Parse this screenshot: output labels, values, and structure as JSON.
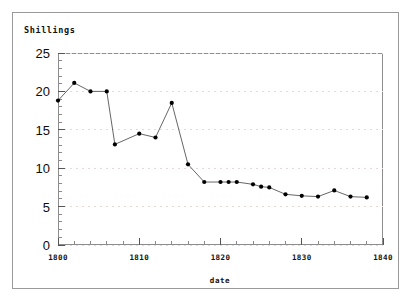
{
  "figure": {
    "y_axis_title": "Shillings",
    "x_axis_title": "date"
  },
  "chart_data": {
    "type": "line",
    "title": "",
    "subtitle": "",
    "xlabel": "date",
    "ylabel": "Shillings",
    "xlim": [
      1800,
      1840
    ],
    "ylim": [
      0,
      25
    ],
    "grid": true,
    "grid_axis": "y",
    "grid_style": "dotted",
    "legend": false,
    "legend_position": "none",
    "marker": "filled-circle",
    "line_color": "#555555",
    "marker_color": "#000000",
    "x_major_ticks": [
      1800,
      1810,
      1820,
      1830,
      1840
    ],
    "x_major_tick_labels": [
      "1800",
      "1810",
      "1820",
      "1830",
      "1840"
    ],
    "x_minor_tick_interval": 2,
    "y_major_ticks": [
      0,
      5,
      10,
      15,
      20,
      25
    ],
    "y_major_tick_labels": [
      "0",
      "5",
      "10",
      "15",
      "20",
      "25"
    ],
    "y_minor_tick_interval": 1,
    "x": [
      1800,
      1802,
      1804,
      1806,
      1807,
      1810,
      1812,
      1814,
      1816,
      1818,
      1820,
      1821,
      1822,
      1824,
      1825,
      1826,
      1828,
      1830,
      1832,
      1834,
      1836,
      1838
    ],
    "values": [
      18.8,
      21.1,
      20.0,
      20.0,
      13.1,
      14.5,
      14.0,
      18.5,
      10.5,
      8.2,
      8.2,
      8.2,
      8.2,
      7.9,
      7.6,
      7.5,
      6.6,
      6.4,
      6.3,
      7.1,
      6.3,
      6.2
    ],
    "points": [
      {
        "x": 1800,
        "y": 18.8
      },
      {
        "x": 1802,
        "y": 21.1
      },
      {
        "x": 1804,
        "y": 20.0
      },
      {
        "x": 1806,
        "y": 20.0
      },
      {
        "x": 1807,
        "y": 13.1
      },
      {
        "x": 1810,
        "y": 14.5
      },
      {
        "x": 1812,
        "y": 14.0
      },
      {
        "x": 1814,
        "y": 18.5
      },
      {
        "x": 1816,
        "y": 10.5
      },
      {
        "x": 1818,
        "y": 8.2
      },
      {
        "x": 1820,
        "y": 8.2
      },
      {
        "x": 1821,
        "y": 8.2
      },
      {
        "x": 1822,
        "y": 8.2
      },
      {
        "x": 1824,
        "y": 7.9
      },
      {
        "x": 1825,
        "y": 7.6
      },
      {
        "x": 1826,
        "y": 7.5
      },
      {
        "x": 1828,
        "y": 6.6
      },
      {
        "x": 1830,
        "y": 6.4
      },
      {
        "x": 1832,
        "y": 6.3
      },
      {
        "x": 1834,
        "y": 7.1
      },
      {
        "x": 1836,
        "y": 6.3
      },
      {
        "x": 1838,
        "y": 6.2
      }
    ]
  }
}
